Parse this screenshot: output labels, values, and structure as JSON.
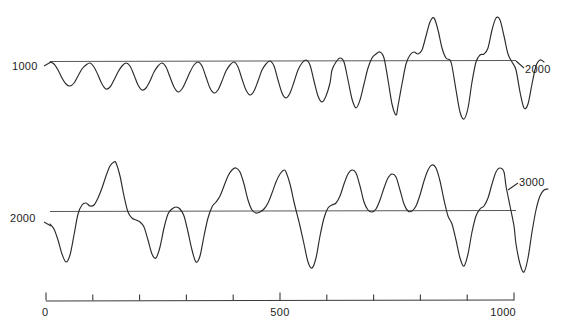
{
  "figure": {
    "background_color": "#ffffff",
    "line_color": "#2b2b2b",
    "baseline_color": "#5a5a5a",
    "axis_color": "#3a3a3a"
  },
  "traces": {
    "top": {
      "left_label": "1000",
      "right_label": "2000"
    },
    "bottom": {
      "left_label": "2000",
      "right_label": "3000"
    }
  },
  "axis": {
    "tick_labels": [
      "0",
      "500",
      "1000"
    ],
    "tick_label_left": "0",
    "tick_label_mid": "500",
    "tick_label_right": "1000"
  },
  "chart_data": {
    "type": "line",
    "title": "",
    "subtitle": "",
    "xlabel": "",
    "ylabel": "",
    "xlim": [
      0,
      1000
    ],
    "grid": false,
    "legend": null,
    "annotations": [
      {
        "text": "1000",
        "attach": "top-trace-left"
      },
      {
        "text": "2000",
        "attach": "top-trace-right"
      },
      {
        "text": "2000",
        "attach": "bottom-trace-left"
      },
      {
        "text": "3000",
        "attach": "bottom-trace-right"
      }
    ],
    "axes": [
      {
        "name": "time-axis",
        "orientation": "horizontal",
        "range": [
          0,
          1000
        ],
        "major_ticks": [
          0,
          500,
          1000
        ],
        "minor_tick_interval": 100,
        "tick_values": [
          0,
          100,
          200,
          300,
          400,
          500,
          600,
          700,
          800,
          900,
          1000
        ],
        "tick_labels": [
          "0",
          "500",
          "1000"
        ]
      }
    ],
    "series": [
      {
        "name": "top-trace",
        "description": "Oscillation record, time 1000 to 2000; low-amplitude sinusoid growing into large-amplitude relaxation oscillations with sharp positive spikes",
        "x_start_label": "1000",
        "x_end_label": "2000",
        "baseline_y_px": 62,
        "points": [
          [
            50,
            62
          ],
          [
            54,
            64
          ],
          [
            58,
            70
          ],
          [
            62,
            78
          ],
          [
            66,
            84
          ],
          [
            70,
            86
          ],
          [
            74,
            83
          ],
          [
            78,
            76
          ],
          [
            82,
            69
          ],
          [
            86,
            65
          ],
          [
            90,
            63
          ],
          [
            94,
            67
          ],
          [
            98,
            75
          ],
          [
            102,
            84
          ],
          [
            106,
            89
          ],
          [
            110,
            87
          ],
          [
            114,
            80
          ],
          [
            118,
            72
          ],
          [
            122,
            66
          ],
          [
            126,
            63
          ],
          [
            130,
            66
          ],
          [
            134,
            75
          ],
          [
            138,
            85
          ],
          [
            142,
            90
          ],
          [
            146,
            88
          ],
          [
            150,
            81
          ],
          [
            154,
            72
          ],
          [
            158,
            66
          ],
          [
            162,
            63
          ],
          [
            166,
            67
          ],
          [
            170,
            77
          ],
          [
            174,
            87
          ],
          [
            178,
            92
          ],
          [
            182,
            89
          ],
          [
            186,
            81
          ],
          [
            190,
            72
          ],
          [
            194,
            65
          ],
          [
            198,
            62
          ],
          [
            202,
            66
          ],
          [
            206,
            77
          ],
          [
            210,
            88
          ],
          [
            214,
            93
          ],
          [
            218,
            90
          ],
          [
            222,
            81
          ],
          [
            226,
            71
          ],
          [
            230,
            65
          ],
          [
            234,
            62
          ],
          [
            238,
            67
          ],
          [
            242,
            79
          ],
          [
            246,
            90
          ],
          [
            250,
            95
          ],
          [
            254,
            91
          ],
          [
            258,
            81
          ],
          [
            262,
            70
          ],
          [
            266,
            64
          ],
          [
            270,
            61
          ],
          [
            274,
            66
          ],
          [
            278,
            80
          ],
          [
            282,
            93
          ],
          [
            286,
            98
          ],
          [
            290,
            93
          ],
          [
            294,
            82
          ],
          [
            298,
            70
          ],
          [
            302,
            63
          ],
          [
            306,
            60
          ],
          [
            310,
            65
          ],
          [
            314,
            81
          ],
          [
            318,
            96
          ],
          [
            322,
            102
          ],
          [
            326,
            96
          ],
          [
            330,
            83
          ],
          [
            332,
            70
          ],
          [
            336,
            62
          ],
          [
            340,
            58
          ],
          [
            344,
            62
          ],
          [
            348,
            80
          ],
          [
            352,
            99
          ],
          [
            356,
            108
          ],
          [
            360,
            100
          ],
          [
            364,
            84
          ],
          [
            368,
            68
          ],
          [
            372,
            58
          ],
          [
            376,
            54
          ],
          [
            380,
            52
          ],
          [
            384,
            58
          ],
          [
            388,
            80
          ],
          [
            392,
            104
          ],
          [
            396,
            115
          ],
          [
            398,
            106
          ],
          [
            402,
            84
          ],
          [
            406,
            64
          ],
          [
            410,
            55
          ],
          [
            414,
            52
          ],
          [
            418,
            54
          ],
          [
            422,
            50
          ],
          [
            426,
            36
          ],
          [
            430,
            22
          ],
          [
            434,
            18
          ],
          [
            438,
            30
          ],
          [
            442,
            48
          ],
          [
            446,
            58
          ],
          [
            450,
            60
          ],
          [
            452,
            66
          ],
          [
            456,
            90
          ],
          [
            460,
            112
          ],
          [
            464,
            119
          ],
          [
            468,
            108
          ],
          [
            472,
            82
          ],
          [
            476,
            62
          ],
          [
            480,
            55
          ],
          [
            484,
            54
          ],
          [
            488,
            48
          ],
          [
            492,
            30
          ],
          [
            496,
            18
          ],
          [
            500,
            20
          ],
          [
            504,
            36
          ],
          [
            508,
            54
          ],
          [
            512,
            62
          ],
          [
            516,
            70
          ],
          [
            520,
            92
          ],
          [
            524,
            108
          ],
          [
            528,
            104
          ],
          [
            532,
            84
          ],
          [
            536,
            66
          ],
          [
            540,
            60
          ],
          [
            544,
            62
          ]
        ]
      },
      {
        "name": "bottom-trace",
        "description": "Oscillation record, time 2000 to 3000; fully-developed relaxation oscillations with tall asymmetric positive spikes and deep negative troughs",
        "x_start_label": "2000",
        "x_end_label": "3000",
        "baseline_y_px": 211,
        "points": [
          [
            50,
            224
          ],
          [
            54,
            229
          ],
          [
            58,
            240
          ],
          [
            62,
            254
          ],
          [
            66,
            262
          ],
          [
            70,
            255
          ],
          [
            74,
            235
          ],
          [
            78,
            214
          ],
          [
            82,
            205
          ],
          [
            86,
            203
          ],
          [
            90,
            206
          ],
          [
            94,
            205
          ],
          [
            98,
            198
          ],
          [
            102,
            188
          ],
          [
            106,
            176
          ],
          [
            110,
            166
          ],
          [
            114,
            162
          ],
          [
            116,
            163
          ],
          [
            120,
            176
          ],
          [
            124,
            196
          ],
          [
            128,
            212
          ],
          [
            132,
            218
          ],
          [
            136,
            220
          ],
          [
            140,
            222
          ],
          [
            144,
            227
          ],
          [
            148,
            240
          ],
          [
            152,
            254
          ],
          [
            156,
            258
          ],
          [
            160,
            247
          ],
          [
            164,
            228
          ],
          [
            168,
            214
          ],
          [
            172,
            209
          ],
          [
            176,
            207
          ],
          [
            180,
            209
          ],
          [
            184,
            216
          ],
          [
            188,
            232
          ],
          [
            192,
            250
          ],
          [
            196,
            262
          ],
          [
            200,
            256
          ],
          [
            204,
            236
          ],
          [
            208,
            218
          ],
          [
            212,
            207
          ],
          [
            216,
            202
          ],
          [
            220,
            196
          ],
          [
            224,
            186
          ],
          [
            228,
            176
          ],
          [
            232,
            170
          ],
          [
            236,
            168
          ],
          [
            240,
            172
          ],
          [
            244,
            184
          ],
          [
            248,
            200
          ],
          [
            252,
            210
          ],
          [
            256,
            213
          ],
          [
            260,
            212
          ],
          [
            264,
            209
          ],
          [
            268,
            203
          ],
          [
            272,
            193
          ],
          [
            276,
            182
          ],
          [
            280,
            174
          ],
          [
            284,
            170
          ],
          [
            286,
            172
          ],
          [
            290,
            184
          ],
          [
            294,
            202
          ],
          [
            298,
            218
          ],
          [
            300,
            226
          ],
          [
            304,
            244
          ],
          [
            308,
            262
          ],
          [
            312,
            268
          ],
          [
            316,
            258
          ],
          [
            320,
            236
          ],
          [
            324,
            218
          ],
          [
            328,
            208
          ],
          [
            332,
            205
          ],
          [
            336,
            203
          ],
          [
            340,
            196
          ],
          [
            344,
            184
          ],
          [
            348,
            174
          ],
          [
            352,
            170
          ],
          [
            356,
            173
          ],
          [
            360,
            186
          ],
          [
            364,
            202
          ],
          [
            368,
            210
          ],
          [
            372,
            212
          ],
          [
            376,
            209
          ],
          [
            380,
            200
          ],
          [
            384,
            188
          ],
          [
            388,
            178
          ],
          [
            392,
            174
          ],
          [
            396,
            177
          ],
          [
            400,
            190
          ],
          [
            404,
            204
          ],
          [
            408,
            211
          ],
          [
            412,
            211
          ],
          [
            416,
            206
          ],
          [
            420,
            195
          ],
          [
            424,
            181
          ],
          [
            428,
            170
          ],
          [
            432,
            165
          ],
          [
            436,
            168
          ],
          [
            440,
            181
          ],
          [
            444,
            200
          ],
          [
            448,
            216
          ],
          [
            452,
            224
          ],
          [
            456,
            240
          ],
          [
            460,
            258
          ],
          [
            464,
            266
          ],
          [
            468,
            254
          ],
          [
            472,
            232
          ],
          [
            476,
            216
          ],
          [
            480,
            209
          ],
          [
            484,
            206
          ],
          [
            488,
            198
          ],
          [
            492,
            184
          ],
          [
            496,
            172
          ],
          [
            500,
            168
          ],
          [
            504,
            172
          ],
          [
            506,
            186
          ],
          [
            510,
            206
          ],
          [
            514,
            226
          ],
          [
            516,
            244
          ],
          [
            520,
            264
          ],
          [
            524,
            272
          ],
          [
            528,
            258
          ],
          [
            532,
            232
          ],
          [
            536,
            210
          ],
          [
            540,
            196
          ],
          [
            544,
            190
          ],
          [
            548,
            189
          ]
        ]
      }
    ]
  }
}
